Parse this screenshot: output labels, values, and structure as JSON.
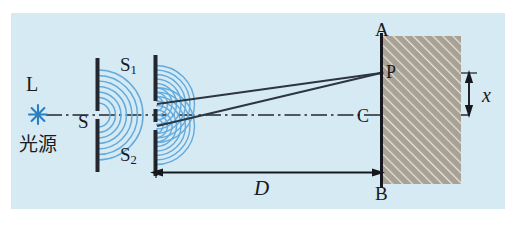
{
  "figure": {
    "kind": "optics-diagram",
    "background_color": "#d6eaf4",
    "page_color": "#ffffff",
    "ink_color": "#1a1a20",
    "wave_color": "#5aa8dc",
    "screen_fill_color": "#a09a8e",
    "ray_color": "#2c3540"
  },
  "labels": {
    "lamp": "L",
    "light_source_cjk": "光源",
    "single_slit": "S",
    "slit_one_base": "S",
    "slit_one_sub": "1",
    "slit_two_base": "S",
    "slit_two_sub": "2",
    "screen_top": "A",
    "screen_bottom": "B",
    "screen_center": "C",
    "bright_point": "P",
    "distance_D": "D",
    "fringe_x": "x"
  },
  "elements": {
    "light_source_icon": "starburst-icon",
    "optical_axis": "dash-dot-center-line",
    "single_slit_barrier": "vertical-barrier-with-one-gap",
    "double_slit_barrier": "vertical-barrier-with-two-gaps",
    "wavefronts_single": "concentric-circular-wavefronts",
    "wavefronts_double": "two-sets-of-circular-wavefronts",
    "rays": "two-straight-rays-to-P",
    "screen": "hatched-rectangle-screen",
    "distance_arrow_D": "horizontal-double-headed-arrow",
    "distance_arrow_x": "vertical-double-headed-arrow"
  },
  "geometry": {
    "axis_y": 115,
    "source_x": 38,
    "single_slit_x": 98,
    "double_slit_x": 156,
    "screen_left_x": 381,
    "screen_right_x": 461,
    "screen_top_y": 36,
    "screen_bottom_y": 184,
    "point_p_y": 73,
    "slit1_y": 104,
    "slit2_y": 126
  }
}
